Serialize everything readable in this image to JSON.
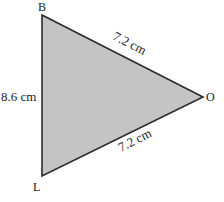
{
  "diagram": {
    "type": "triangle",
    "fill_color": "#c4c4c4",
    "stroke_color": "#2a2a2a",
    "vertices": [
      {
        "name": "B",
        "x": 42,
        "y": 15
      },
      {
        "name": "O",
        "x": 203,
        "y": 97
      },
      {
        "name": "L",
        "x": 42,
        "y": 176
      }
    ],
    "vertex_labels": {
      "B": "B",
      "O": "O",
      "L": "L"
    },
    "sides": {
      "BO": "7.2 cm",
      "BL": "8.6 cm",
      "LO": "7.2 cm"
    }
  }
}
